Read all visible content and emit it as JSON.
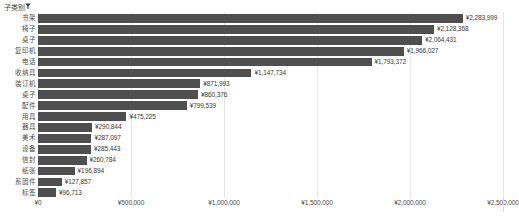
{
  "header": {
    "filter_label": "子类别",
    "filter_icon": "funnel-icon"
  },
  "axis": {
    "ticks": [
      "¥0",
      "¥500,000",
      "¥1,000,000",
      "¥1,500,000",
      "¥2,000,000",
      "¥2,500,000"
    ]
  },
  "chart_data": {
    "type": "bar",
    "orientation": "horizontal",
    "title": "",
    "xlabel": "",
    "ylabel": "",
    "xlim": [
      0,
      2500000
    ],
    "grid": true,
    "legend": "none",
    "currency_symbol": "¥",
    "categories": [
      "书架",
      "椅子",
      "桌子",
      "复印机",
      "电话",
      "收纳具",
      "装订机",
      "桌子",
      "配件",
      "用具",
      "器具",
      "美术",
      "设备",
      "信封",
      "纸张",
      "系固件",
      "标签"
    ],
    "values": [
      2283999,
      2128368,
      2064431,
      1966027,
      1793372,
      1147734,
      871993,
      860376,
      799539,
      475225,
      290844,
      287097,
      285443,
      260784,
      196894,
      127857,
      96713
    ],
    "value_labels": [
      "¥2,283,999",
      "¥2,128,368",
      "¥2,064,431",
      "¥1,966,027",
      "¥1,793,372",
      "¥1,147,734",
      "¥871,993",
      "¥860,376",
      "¥799,539",
      "¥475,225",
      "¥290,844",
      "¥287,097",
      "¥285,443",
      "¥260,784",
      "¥196,894",
      "¥127,857",
      "¥96,713"
    ],
    "bar_color": "#4f4f4f",
    "gridline_color": "#e6e6e6"
  }
}
